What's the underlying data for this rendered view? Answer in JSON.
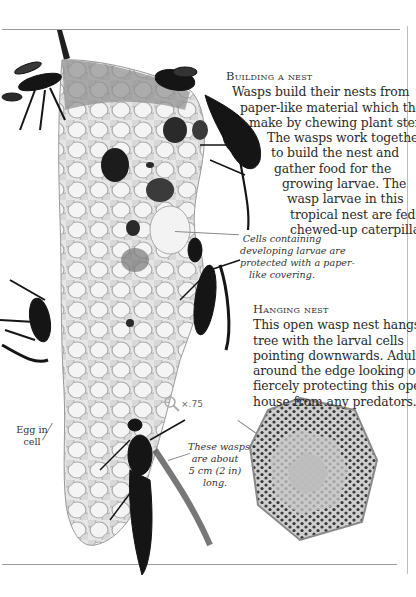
{
  "sections": {
    "building": {
      "heading": "Building a nest",
      "lines": [
        "Wasps build their nests from",
        "paper-like material which they",
        "make by chewing plant stems.",
        "The wasps work together",
        "to build the nest and",
        "gather food for the",
        "growing larvae. The",
        "wasp larvae in this",
        "tropical nest are fed on",
        "chewed-up caterpillars."
      ]
    },
    "hanging": {
      "heading": "Hanging nest",
      "lines": [
        "This open wasp nest hangs in a",
        "tree with the larval cells",
        "pointing downwards. Adults sit",
        "around the edge looking out,",
        "fiercely protecting this open",
        "house from any predators."
      ]
    }
  },
  "captions": {
    "cells": [
      "Cells containing",
      "developing larvae are",
      "protected with a paper-",
      "like covering."
    ],
    "egg": [
      "Egg in",
      "cell"
    ],
    "size": [
      "These wasps",
      "are about",
      "5 cm (2 in)",
      "long."
    ]
  },
  "scale": {
    "icon": "magnifier-icon",
    "value": "×.75"
  }
}
